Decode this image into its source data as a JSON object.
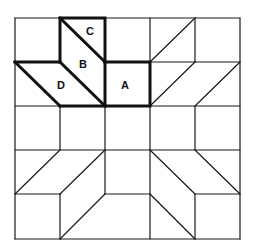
{
  "diagram": {
    "title": "",
    "labels": [
      {
        "id": "A",
        "text": "A",
        "piece": "square"
      },
      {
        "id": "B",
        "text": "B",
        "piece": "parallelogram"
      },
      {
        "id": "C",
        "text": "C",
        "piece": "triangle"
      },
      {
        "id": "D",
        "text": "D",
        "piece": "parallelogram"
      }
    ],
    "grid": {
      "rows": 5,
      "cols": 5
    },
    "colors": {
      "line": "#1a1a1a",
      "background": "#ffffff"
    }
  }
}
